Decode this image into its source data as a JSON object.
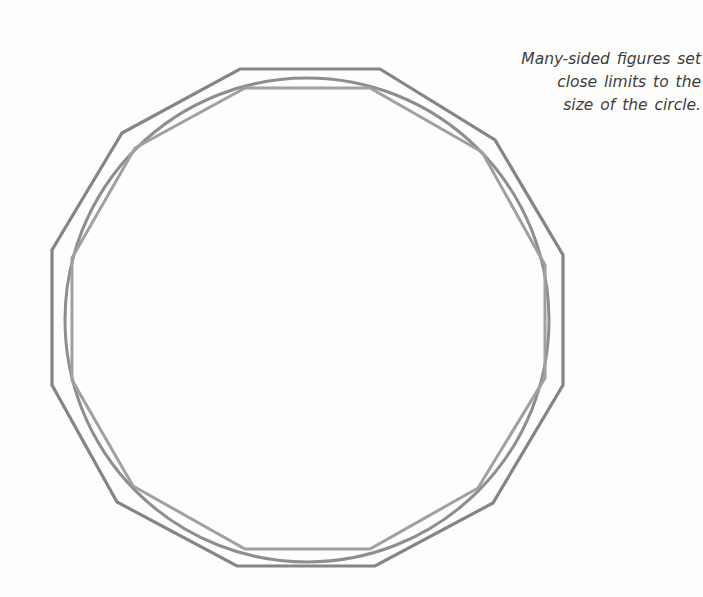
{
  "caption": {
    "lines": [
      "Many-sided figures set",
      "close limits to the",
      "size of the circle."
    ]
  },
  "diagram": {
    "sides": 12,
    "colors": {
      "background": "#fdfdfc",
      "outer_polygon": "#858585",
      "circle": "#8e8e8e",
      "inner_polygon": "#a0a0a0",
      "text": "#3d3d3d"
    },
    "circle": {
      "cx": 307,
      "cy": 320,
      "r": 242
    },
    "outer_polygon_points": "240,69 380,69 495,140 563,255 563,385 493,503 375,566 237,566 117,502 52,385 52,250 122,133",
    "inner_polygon_points": "245,88 370,88 482,152 545,265 545,378 478,488 370,549 245,549 133,486 72,380 72,258 135,148"
  }
}
